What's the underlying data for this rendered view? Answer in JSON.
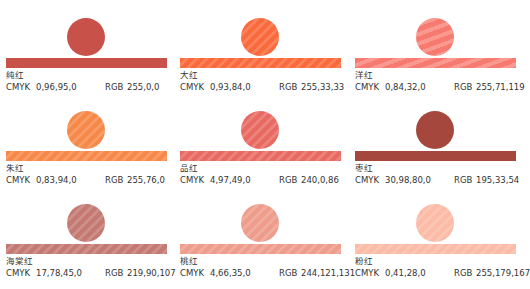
{
  "labels": {
    "cmyk": "CMYK",
    "rgb": "RGB"
  },
  "swatches": [
    {
      "name": "纯红",
      "cmyk": "0,96,95,0",
      "rgb": "255,0,0",
      "color": "#c8524a",
      "texture": "solid"
    },
    {
      "name": "大红",
      "cmyk": "0,93,84,0",
      "rgb": "255,33,33",
      "color": "#fb6a3c",
      "texture": "stripes"
    },
    {
      "name": "洋红",
      "cmyk": "0,84,32,0",
      "rgb": "255,71,119",
      "color": "#f77a70",
      "texture": "wavy"
    },
    {
      "name": "朱红",
      "cmyk": "0,83,94,0",
      "rgb": "255,76,0",
      "color": "#f6884a",
      "texture": "stripes"
    },
    {
      "name": "品红",
      "cmyk": "4,97,49,0",
      "rgb": "240,0,86",
      "color": "#e86a63",
      "texture": "stripes"
    },
    {
      "name": "枣红",
      "cmyk": "30,98,80,0",
      "rgb": "195,33,54",
      "color": "#a5473d",
      "texture": "solid"
    },
    {
      "name": "海棠红",
      "cmyk": "17,78,45,0",
      "rgb": "219,90,107",
      "color": "#c47a72",
      "texture": "stripes"
    },
    {
      "name": "桃红",
      "cmyk": "4,66,35,0",
      "rgb": "244,121,131",
      "color": "#ee9c8c",
      "texture": "stripes"
    },
    {
      "name": "粉红",
      "cmyk": "0,41,28,0",
      "rgb": "255,179,167",
      "color": "#fcbba7",
      "texture": "stripes"
    }
  ]
}
